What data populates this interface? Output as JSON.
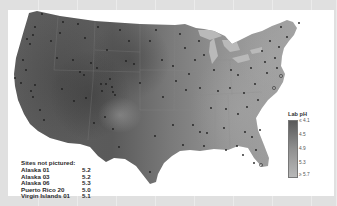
{
  "map": {
    "title": "Lab pH monitoring sites, contiguous United States",
    "region": "Contiguous United States",
    "colormap": "grayscale, darker = more acidic"
  },
  "legend": {
    "title": "Lab pH",
    "ticks": [
      "≤ 4.1",
      "4.5",
      "4.9",
      "5.3",
      "≥ 5.7"
    ],
    "color_low": "#5a5a5a",
    "color_high": "#b8b8b8"
  },
  "sites_not_pictured": {
    "header": "Sites not pictured:",
    "rows": [
      {
        "name": "Alaska 01",
        "value": "5.2"
      },
      {
        "name": "Alaska 03",
        "value": "5.2"
      },
      {
        "name": "Alaska 06",
        "value": "5.3"
      },
      {
        "name": "Puerto Rico 20",
        "value": "5.0"
      },
      {
        "name": "Virgin Islands 01",
        "value": "5.1"
      }
    ]
  }
}
